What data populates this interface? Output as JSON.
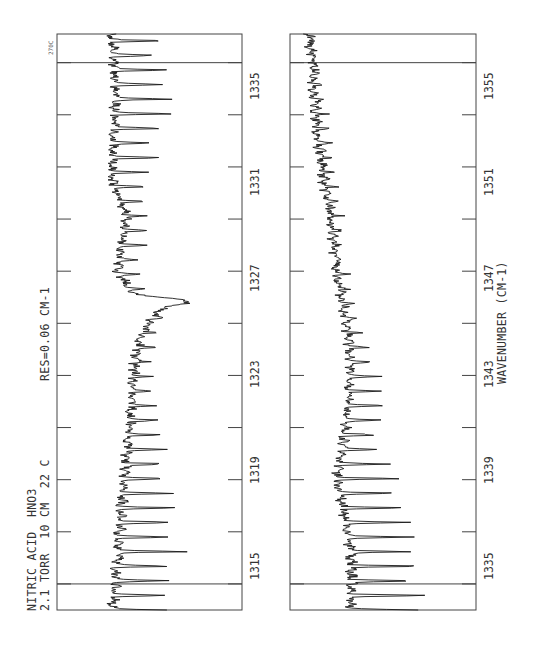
{
  "chart_data": {
    "type": "line",
    "orientation": "rotated-90-ccw",
    "title": "NITRIC ACID  HNO3",
    "subtitle": "2.1 TORR  10 CM  22 C",
    "annotation_res": "RES=0.06 CM-1",
    "annotation_corner": "270C",
    "xlabel": "WAVENUMBER (CM-1)",
    "ylabel": "Transmittance (relative, unlabeled)",
    "grid": false,
    "panels": [
      {
        "name": "left-panel",
        "xlim": [
          1314.0,
          1336.1
        ],
        "tick_labels": [
          "1315",
          "1319",
          "1323",
          "1327",
          "1331",
          "1335"
        ],
        "tick_values": [
          1315,
          1317,
          1319,
          1321,
          1323,
          1325,
          1327,
          1329,
          1331,
          1333,
          1335
        ],
        "marker_lines": [
          1315,
          1335
        ],
        "baseline_points": [
          [
            1314.0,
            0.3
          ],
          [
            1316.0,
            0.33
          ],
          [
            1318.0,
            0.35
          ],
          [
            1320.0,
            0.38
          ],
          [
            1322.0,
            0.4
          ],
          [
            1323.5,
            0.42
          ],
          [
            1324.5,
            0.45
          ],
          [
            1325.5,
            0.55
          ],
          [
            1325.9,
            0.72
          ],
          [
            1326.1,
            0.42
          ],
          [
            1327.0,
            0.33
          ],
          [
            1329.0,
            0.38
          ],
          [
            1330.5,
            0.3
          ],
          [
            1332.0,
            0.3
          ],
          [
            1334.0,
            0.32
          ],
          [
            1336.1,
            0.3
          ]
        ],
        "depth_points": [
          [
            1314.0,
            0.3
          ],
          [
            1317.0,
            0.3
          ],
          [
            1319.0,
            0.25
          ],
          [
            1321.0,
            0.2
          ],
          [
            1322.5,
            0.12
          ],
          [
            1324.0,
            0.08
          ],
          [
            1325.5,
            0.06
          ],
          [
            1326.1,
            0.04
          ],
          [
            1327.0,
            0.08
          ],
          [
            1329.0,
            0.1
          ],
          [
            1330.5,
            0.22
          ],
          [
            1332.0,
            0.28
          ],
          [
            1334.0,
            0.28
          ],
          [
            1336.1,
            0.28
          ]
        ],
        "line_spacing_cm": 0.56
      },
      {
        "name": "right-panel",
        "xlim": [
          1334.0,
          1356.1
        ],
        "tick_labels": [
          "1335",
          "1339",
          "1343",
          "1347",
          "1351",
          "1355"
        ],
        "tick_values": [
          1335,
          1337,
          1339,
          1341,
          1343,
          1345,
          1347,
          1349,
          1351,
          1353,
          1355
        ],
        "marker_lines": [
          1335,
          1355
        ],
        "baseline_points": [
          [
            1334.0,
            0.33
          ],
          [
            1336.0,
            0.33
          ],
          [
            1338.0,
            0.28
          ],
          [
            1339.0,
            0.25
          ],
          [
            1341.0,
            0.3
          ],
          [
            1343.0,
            0.33
          ],
          [
            1345.0,
            0.3
          ],
          [
            1347.0,
            0.25
          ],
          [
            1349.0,
            0.22
          ],
          [
            1351.0,
            0.17
          ],
          [
            1353.0,
            0.14
          ],
          [
            1355.0,
            0.12
          ],
          [
            1356.1,
            0.1
          ]
        ],
        "depth_points": [
          [
            1334.0,
            0.33
          ],
          [
            1337.0,
            0.34
          ],
          [
            1339.0,
            0.3
          ],
          [
            1340.5,
            0.18
          ],
          [
            1342.0,
            0.14
          ],
          [
            1344.0,
            0.1
          ],
          [
            1346.0,
            0.08
          ],
          [
            1348.0,
            0.05
          ],
          [
            1350.0,
            0.04
          ],
          [
            1352.0,
            0.04
          ],
          [
            1356.1,
            0.03
          ]
        ],
        "line_spacing_cm": 0.56
      }
    ]
  },
  "labels": {
    "title": "NITRIC ACID  HNO3",
    "conditions": "2.1 TORR  10 CM  22 C",
    "resolution": "RES=0.06 CM-1",
    "corner": "270C",
    "xlabel": "WAVENUMBER (CM-1)",
    "left_ticks": [
      "1315",
      "1319",
      "1323",
      "1327",
      "1331",
      "1335"
    ],
    "right_ticks": [
      "1335",
      "1339",
      "1343",
      "1347",
      "1351",
      "1355"
    ]
  },
  "colors": {
    "line": "#1a1a1a",
    "frame": "#444444",
    "background": "#ffffff"
  }
}
